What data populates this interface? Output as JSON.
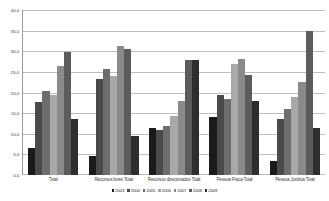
{
  "chart_data": {
    "type": "bar",
    "title": "",
    "xlabel": "",
    "ylabel": "",
    "ylim": [
      0.0,
      40.0
    ],
    "grid": true,
    "legend_position": "bottom",
    "ytick_labels": [
      "0,0",
      "5,0",
      "10,0",
      "15,0",
      "20,0",
      "25,0",
      "30,0",
      "35,0",
      "40,0"
    ],
    "ytick_values": [
      0.0,
      5.0,
      10.0,
      15.0,
      20.0,
      25.0,
      30.0,
      35.0,
      40.0
    ],
    "categories": [
      "Total",
      "Recursos livres Total",
      "Recursos direcionados Total",
      "Pessoa Fisica Total",
      "Pessoa Juridica Total"
    ],
    "series": [
      {
        "name": "2003",
        "color": "#1a1a1a",
        "values": [
          6.5,
          4.5,
          11.5,
          14.0,
          3.5
        ]
      },
      {
        "name": "2004",
        "color": "#4a4a4a",
        "values": [
          17.8,
          23.2,
          11.0,
          19.5,
          13.5
        ]
      },
      {
        "name": "2005",
        "color": "#6e6e6e",
        "values": [
          20.3,
          25.8,
          12.0,
          18.5,
          16.0
        ]
      },
      {
        "name": "2006",
        "color": "#a8a8a8",
        "values": [
          19.4,
          24.0,
          14.4,
          27.0,
          19.0
        ]
      },
      {
        "name": "2007",
        "color": "#8a8a8a",
        "values": [
          26.4,
          31.3,
          18.0,
          28.2,
          22.5
        ]
      },
      {
        "name": "2008",
        "color": "#5c5c5c",
        "values": [
          29.8,
          30.5,
          28.0,
          24.3,
          35.0
        ]
      },
      {
        "name": "2009",
        "color": "#2e2e2e",
        "values": [
          13.7,
          9.5,
          28.0,
          18.0,
          11.5
        ]
      }
    ]
  }
}
